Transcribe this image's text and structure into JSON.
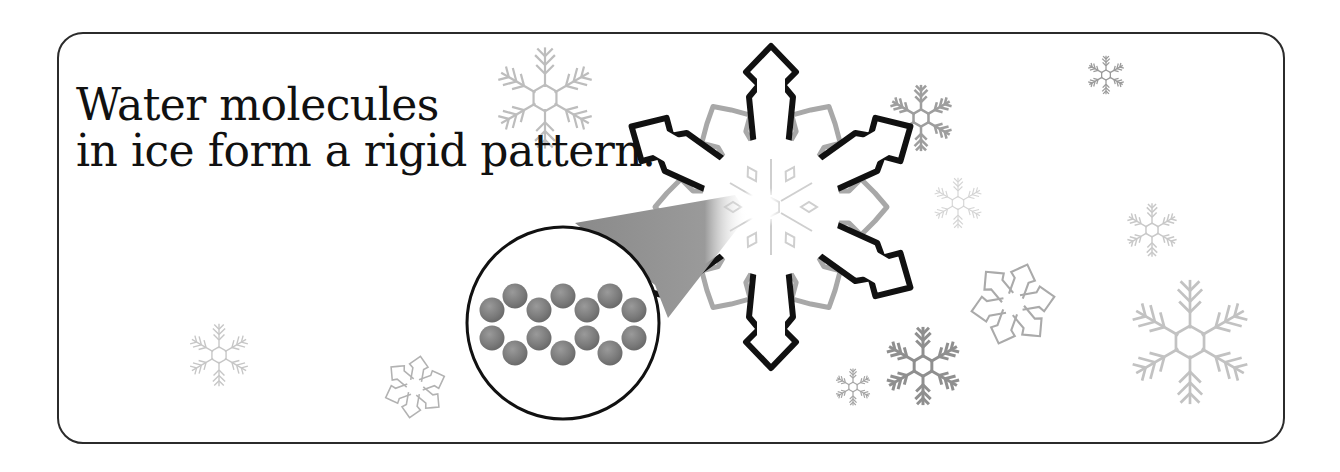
{
  "caption": {
    "line1": "Water molecules",
    "line2": "in ice form a rigid pattern."
  },
  "figure": {
    "main_snowflake": {
      "icon": "snowflake-icon",
      "center": [
        771,
        207
      ],
      "arm_count": 6
    },
    "magnifier": {
      "icon": "magnifier-circle",
      "center": [
        563,
        323
      ],
      "radius": 97,
      "molecule_count": 14
    },
    "colors": {
      "border": "#2b2b2b",
      "snowflake_outline": "#111111",
      "inner_star_outline": "#a8a8a8",
      "cone": "#8c8c8c",
      "molecule": "#7a7a7a",
      "background_snowflakes": "#b5b5b5"
    }
  }
}
